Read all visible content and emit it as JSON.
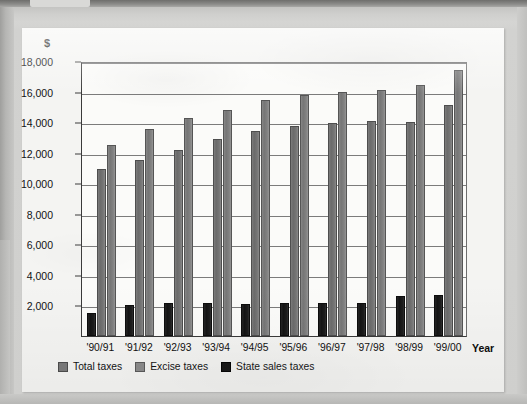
{
  "chart_data": {
    "type": "bar",
    "title": "",
    "xlabel": "Year",
    "ylabel": "$",
    "ylim": [
      0,
      18000
    ],
    "ytick_step": 2000,
    "grid": true,
    "legend_position": "bottom-left",
    "categories": [
      "'90/91",
      "'91/92",
      "'92/93",
      "'93/94",
      "'94/95",
      "'95/96",
      "'96/97",
      "'97/98",
      "'98/99",
      "'99/00"
    ],
    "ytick_labels": [
      "18,000",
      "16,000",
      "14,000",
      "12,000",
      "10,000",
      "8,000",
      "6,000",
      "4,000",
      "2,000"
    ],
    "ytick_values": [
      18000,
      16000,
      14000,
      12000,
      10000,
      8000,
      6000,
      4000,
      2000
    ],
    "series": [
      {
        "name": "State sales taxes",
        "key": "state",
        "color": "#141414",
        "values": [
          1500,
          2000,
          2150,
          2130,
          2080,
          2150,
          2180,
          2150,
          2620,
          2700
        ]
      },
      {
        "name": "Total taxes",
        "key": "total",
        "color": "#7a7a7a",
        "values": [
          10950,
          11550,
          12200,
          12900,
          13450,
          13750,
          13950,
          14100,
          14000,
          15100
        ]
      },
      {
        "name": "Excise taxes",
        "key": "excise",
        "color": "#8b8b8b",
        "values": [
          12500,
          13550,
          14250,
          14800,
          15450,
          15800,
          16000,
          16100,
          16450,
          17400
        ]
      }
    ],
    "legend": [
      {
        "label": "Total taxes",
        "key": "total"
      },
      {
        "label": "Excise taxes",
        "key": "excise"
      },
      {
        "label": "State sales taxes",
        "key": "state"
      }
    ]
  }
}
